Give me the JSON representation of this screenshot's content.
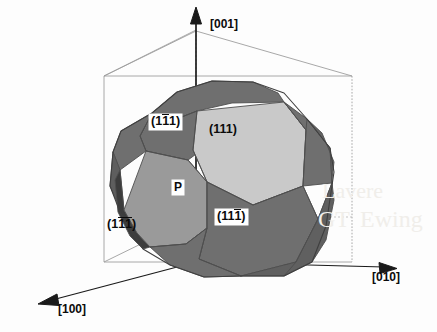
{
  "figure": {
    "background_color": "#fdfdfd",
    "axes": {
      "vertical": {
        "name": "z-axis",
        "label": "[001]"
      },
      "right": {
        "name": "y-axis",
        "label": "[010]"
      },
      "left_front": {
        "name": "x-axis",
        "label": "[100]"
      }
    },
    "faces": [
      {
        "id": "f111",
        "label": "(111)",
        "indices": [
          "1",
          "1",
          "1"
        ],
        "bars": [
          false,
          false,
          false
        ],
        "boxed": false,
        "fill": "#c9c9c9",
        "name": "face-label-111"
      },
      {
        "id": "f1b11",
        "label": "(1̄1̄1)",
        "indices": [
          "1",
          "1",
          "1"
        ],
        "bars": [
          false,
          true,
          false
        ],
        "boxed": true,
        "fill": "#6f6f6f",
        "name": "face-label-1bar11"
      },
      {
        "id": "f11b1",
        "label": "(111̄)",
        "indices": [
          "1",
          "1",
          "1"
        ],
        "bars": [
          false,
          false,
          true
        ],
        "boxed": true,
        "fill": "#6f6f6f",
        "name": "face-label-11bar1"
      },
      {
        "id": "f1b1b",
        "label": "(11̄1̄)",
        "indices": [
          "1",
          "1",
          "1"
        ],
        "bars": [
          false,
          true,
          true
        ],
        "boxed": false,
        "fill": "#9a9a9a",
        "name": "face-label-1bar1bar"
      }
    ],
    "point": {
      "label": "P",
      "boxed": true,
      "name": "point-p"
    },
    "colors": {
      "light_face": "#c9c9c9",
      "mid_face": "#9a9a9a",
      "dark_face": "#6f6f6f",
      "darker_edge": "#5a5a5a",
      "shadow_face": "#3c3c3c",
      "wire": "#9b9b9b",
      "outline": "#4a4a4a",
      "axis": "#1a1a1a",
      "text": "#0b0b0b",
      "background": "#fdfdfd"
    },
    "watermark": {
      "lines": [
        "Lavere",
        "GT",
        "Ewing"
      ]
    }
  }
}
